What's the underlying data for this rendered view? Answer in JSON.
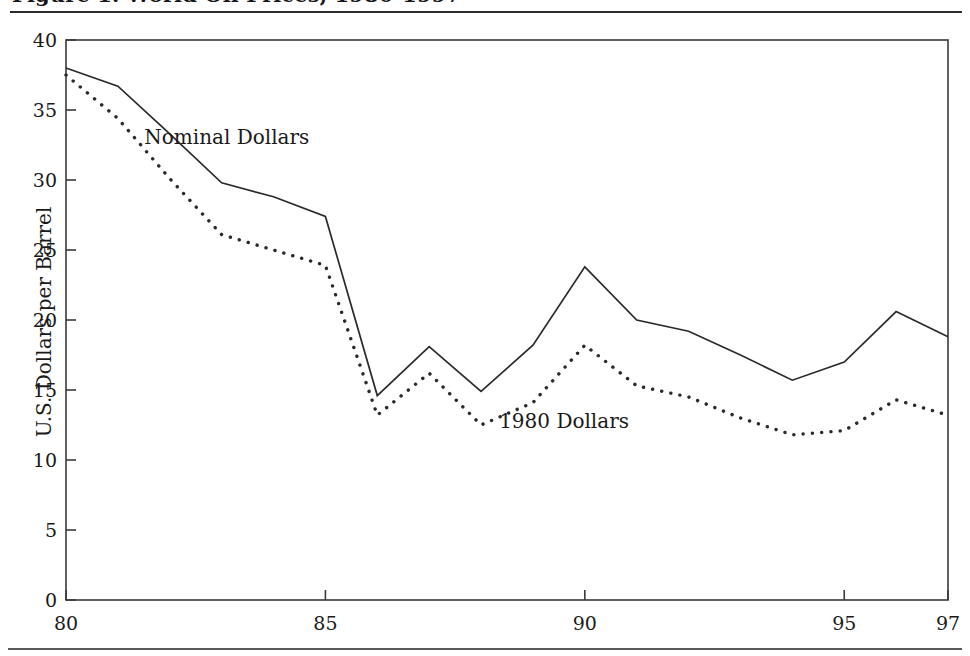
{
  "figure": {
    "title": "Figure 1. World Oil Prices, 1980-1997",
    "ylabel": "U.S. Dollars per Barrel"
  },
  "chart_data": {
    "type": "line",
    "title": "Figure 1. World Oil Prices, 1980-1997",
    "xlabel": "",
    "ylabel": "U.S. Dollars per Barrel",
    "xlim": [
      80,
      97
    ],
    "ylim": [
      0,
      40
    ],
    "grid": false,
    "legend_position": "inline-annotation",
    "xticks": [
      80,
      85,
      90,
      95,
      97
    ],
    "xtick_labels": [
      "80",
      "85",
      "90",
      "95",
      "97"
    ],
    "yticks": [
      0,
      5,
      10,
      15,
      20,
      25,
      30,
      35,
      40
    ],
    "ytick_labels": [
      "0",
      "5",
      "10",
      "15",
      "20",
      "25",
      "30",
      "35",
      "40"
    ],
    "x": [
      80,
      81,
      82,
      83,
      84,
      85,
      86,
      87,
      88,
      89,
      90,
      91,
      92,
      93,
      94,
      95,
      96,
      97
    ],
    "series": [
      {
        "name": "Nominal Dollars",
        "style": "solid",
        "color": "#2a2a2a",
        "values": [
          38.0,
          36.7,
          33.3,
          29.8,
          28.8,
          27.4,
          14.6,
          18.1,
          14.9,
          18.2,
          23.8,
          20.0,
          19.2,
          17.5,
          15.7,
          17.0,
          20.6,
          18.8
        ]
      },
      {
        "name": "1980 Dollars",
        "style": "dotted",
        "color": "#2a2a2a",
        "values": [
          37.5,
          34.4,
          30.1,
          26.1,
          25.0,
          23.9,
          13.2,
          16.2,
          12.5,
          14.1,
          18.2,
          15.3,
          14.5,
          13.0,
          11.8,
          12.1,
          14.3,
          13.2
        ]
      }
    ],
    "annotations": [
      {
        "text": "Nominal Dollars",
        "x": 83.1,
        "y": 32.6
      },
      {
        "text": "1980 Dollars",
        "x": 89.6,
        "y": 12.3
      }
    ]
  }
}
